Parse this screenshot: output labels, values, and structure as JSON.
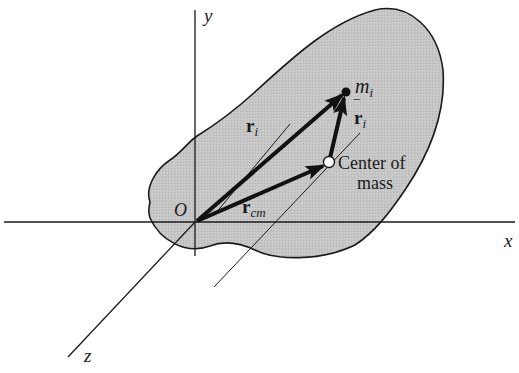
{
  "figure": {
    "type": "center-of-mass position vector diagram",
    "colors": {
      "body_fill": "#c4c4c4",
      "stroke": "#1a1a1a",
      "background": "#ffffff"
    },
    "axes": {
      "x_label": "x",
      "y_label": "y",
      "z_label": "z",
      "origin_label": "O"
    },
    "particle": {
      "label_main": "m",
      "label_sub": "i"
    },
    "vectors": {
      "r_i": {
        "main": "r",
        "sub": "i"
      },
      "r_cm": {
        "main": "r",
        "sub": "cm"
      },
      "r_bar_i": {
        "main": "r",
        "sub": "i",
        "overbar": "‾"
      }
    },
    "center_of_mass": {
      "label_line1": "Center of",
      "label_line2": "mass"
    }
  }
}
